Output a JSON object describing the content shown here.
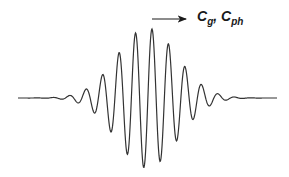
{
  "diagram": {
    "label": {
      "main_symbol": "C",
      "sub1": "g",
      "separator": ", ",
      "main_symbol2": "C",
      "sub2": "ph"
    },
    "arrow": {
      "x1": 152,
      "y1": 19,
      "x2": 186,
      "y2": 19,
      "direction": "right"
    },
    "wave": {
      "baseline_y": 98,
      "x_start": 18,
      "x_end": 277,
      "center_x": 147,
      "amplitude": 70,
      "wavelength": 16.5,
      "envelope_sigma": 30,
      "stroke_color": "#333333"
    }
  }
}
